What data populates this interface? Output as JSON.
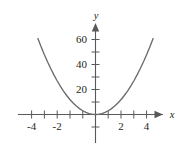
{
  "chart_data": {
    "type": "line",
    "title": "",
    "subtitle": "",
    "xlabel": "x",
    "ylabel": "y",
    "equation": "y = 3x^2",
    "xlim": [
      -5.6,
      5.6
    ],
    "ylim": [
      -22,
      70
    ],
    "grid": false,
    "legend": null,
    "x_tick_labels": [
      "-4",
      "-2",
      "2",
      "4"
    ],
    "x_tick_label_values": [
      -4,
      -2,
      2,
      4
    ],
    "x_tick_values": [
      -5,
      -4,
      -3,
      -2,
      -1,
      1,
      2,
      3,
      4,
      5
    ],
    "y_tick_labels": [
      "20",
      "40",
      "60"
    ],
    "y_tick_label_values": [
      20,
      40,
      60
    ],
    "y_tick_values": [
      -20,
      -10,
      10,
      20,
      30,
      40,
      50,
      60
    ],
    "series": [
      {
        "name": "y = 3x^2",
        "x": [
          -4.5,
          -4.25,
          -4,
          -3.75,
          -3.5,
          -3.25,
          -3,
          -2.75,
          -2.5,
          -2.25,
          -2,
          -1.75,
          -1.5,
          -1.25,
          -1,
          -0.75,
          -0.5,
          -0.25,
          0,
          0.25,
          0.5,
          0.75,
          1,
          1.25,
          1.5,
          1.75,
          2,
          2.25,
          2.5,
          2.75,
          3,
          3.25,
          3.5,
          3.75,
          4,
          4.25,
          4.5
        ],
        "values": [
          60.75,
          54.19,
          48,
          42.19,
          36.75,
          31.69,
          27,
          22.69,
          18.75,
          15.19,
          12,
          9.19,
          6.75,
          4.69,
          3,
          1.69,
          0.75,
          0.19,
          0,
          0.19,
          0.75,
          1.69,
          3,
          4.69,
          6.75,
          9.19,
          12,
          15.19,
          18.75,
          22.69,
          27,
          31.69,
          36.75,
          42.19,
          48,
          54.19,
          60.75
        ]
      }
    ],
    "colors": {
      "axis": "#58595b",
      "curve": "#6a6b6d",
      "text": "#231f20",
      "background": "#ffffff"
    }
  }
}
